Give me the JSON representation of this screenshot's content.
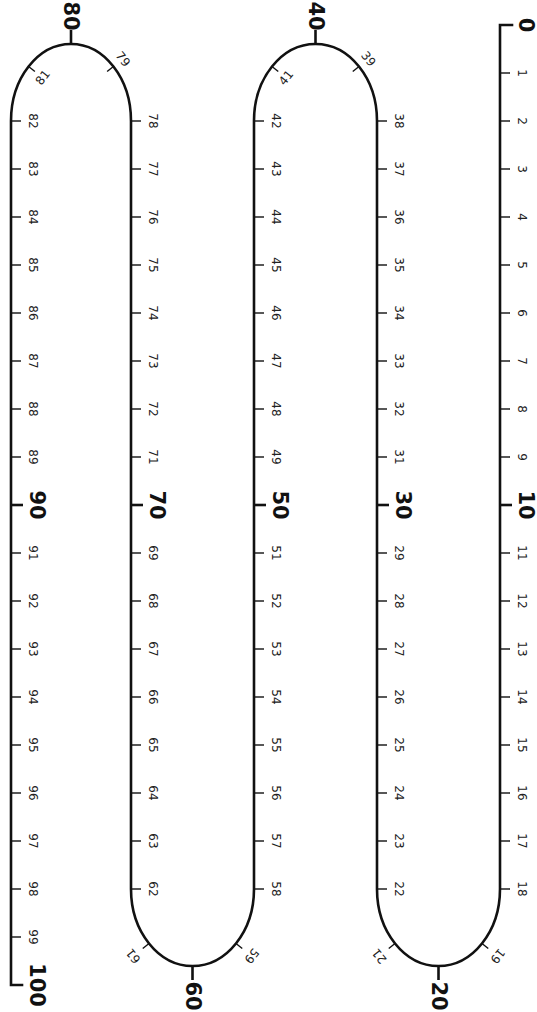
{
  "diagram": {
    "orientation": "rotated 90 degrees clockwise",
    "start_value": 0,
    "end_value": 100,
    "major_step": 10,
    "labels_bold": [
      "0",
      "10",
      "20",
      "30",
      "40",
      "50",
      "60",
      "70",
      "80",
      "90",
      "100"
    ],
    "labels_small": [
      "1",
      "2",
      "3",
      "4",
      "5",
      "6",
      "7",
      "8",
      "9",
      "11",
      "12",
      "13",
      "14",
      "15",
      "16",
      "17",
      "18",
      "19",
      "21",
      "22",
      "23",
      "24",
      "25",
      "26",
      "27",
      "28",
      "29",
      "31",
      "32",
      "33",
      "34",
      "35",
      "36",
      "37",
      "38",
      "39",
      "41",
      "42",
      "43",
      "44",
      "45",
      "46",
      "47",
      "48",
      "49",
      "51",
      "52",
      "53",
      "54",
      "55",
      "56",
      "57",
      "58",
      "59",
      "61",
      "62",
      "63",
      "64",
      "65",
      "66",
      "67",
      "68",
      "69",
      "71",
      "72",
      "73",
      "74",
      "75",
      "76",
      "77",
      "78",
      "79",
      "81",
      "82",
      "83",
      "84",
      "85",
      "86",
      "87",
      "88",
      "89",
      "91",
      "92",
      "93",
      "94",
      "95",
      "96",
      "97",
      "98",
      "99"
    ],
    "segments": [
      {
        "name": "segment-0-18",
        "x": 500,
        "from": 0,
        "to": 18,
        "direction": "down"
      },
      {
        "name": "turn-19-21",
        "values": [
          19,
          20,
          21
        ],
        "position": "bottom",
        "x_left": 377,
        "x_right": 500
      },
      {
        "name": "segment-22-38",
        "x": 377,
        "from": 22,
        "to": 38,
        "direction": "up"
      },
      {
        "name": "turn-39-41",
        "values": [
          39,
          40,
          41
        ],
        "position": "top",
        "x_left": 254,
        "x_right": 377
      },
      {
        "name": "segment-42-58",
        "x": 254,
        "from": 42,
        "to": 58,
        "direction": "down"
      },
      {
        "name": "turn-59-61",
        "values": [
          59,
          60,
          61
        ],
        "position": "bottom",
        "x_left": 131,
        "x_right": 254
      },
      {
        "name": "segment-62-78",
        "x": 131,
        "from": 62,
        "to": 78,
        "direction": "up"
      },
      {
        "name": "turn-79-81",
        "values": [
          79,
          80,
          81
        ],
        "position": "top",
        "x_left": 11,
        "x_right": 131
      },
      {
        "name": "segment-82-100",
        "x": 11,
        "from": 82,
        "to": 100,
        "direction": "down"
      }
    ],
    "colors": {
      "line": "#111111",
      "background": "#ffffff"
    }
  }
}
